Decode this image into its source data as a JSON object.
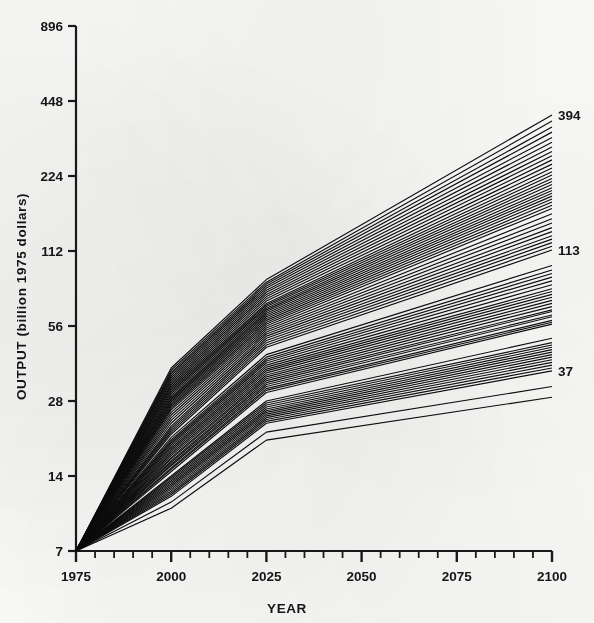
{
  "figure": {
    "name": "output-projection-spaghetti-chart"
  },
  "chart_data": {
    "type": "line",
    "title": "",
    "subtitle": "",
    "xlabel": "YEAR",
    "ylabel": "OUTPUT (billion 1975 dollars)",
    "y_scale": "log2",
    "xlim": [
      1975,
      2100
    ],
    "ylim": [
      7,
      896
    ],
    "grid": false,
    "legend": false,
    "legend_position": "none",
    "x_ticks_major": [
      1975,
      2000,
      2025,
      2050,
      2075,
      2100
    ],
    "x_tick_labels": [
      "1975",
      "2000",
      "2025",
      "2050",
      "2075",
      "2100"
    ],
    "x_ticks_minor_step": 5,
    "y_ticks": [
      7,
      14,
      28,
      56,
      112,
      224,
      448,
      896
    ],
    "y_tick_labels": [
      "7",
      "14",
      "28",
      "56",
      "112",
      "224",
      "448",
      "896"
    ],
    "annotations": [
      {
        "label": "394",
        "x": 2100,
        "y": 394,
        "note": "highest-scenario endpoint"
      },
      {
        "label": "113",
        "x": 2100,
        "y": 113,
        "note": "mid-scenario endpoint"
      },
      {
        "label": "37",
        "x": 2100,
        "y": 37,
        "note": "lowest-scenario endpoint"
      }
    ],
    "x_knots": [
      1975,
      2000,
      2025,
      2100
    ],
    "common_origin": {
      "x": 1975,
      "y": 7
    },
    "series": [
      {
        "name": "S01",
        "values": [
          7,
          38.0,
          86.0,
          394
        ]
      },
      {
        "name": "S02",
        "values": [
          7,
          37.2,
          84.0,
          372
        ]
      },
      {
        "name": "S03",
        "values": [
          7,
          36.5,
          82.5,
          352
        ]
      },
      {
        "name": "S04",
        "values": [
          7,
          36.0,
          81.0,
          336
        ]
      },
      {
        "name": "S05",
        "values": [
          7,
          35.4,
          79.5,
          320
        ]
      },
      {
        "name": "S06",
        "values": [
          7,
          34.8,
          78.0,
          306
        ]
      },
      {
        "name": "S07",
        "values": [
          7,
          34.2,
          76.5,
          293
        ]
      },
      {
        "name": "S08",
        "values": [
          7,
          33.6,
          75.0,
          281
        ]
      },
      {
        "name": "S09",
        "values": [
          7,
          33.0,
          73.5,
          270
        ]
      },
      {
        "name": "S10",
        "values": [
          7,
          32.5,
          72.0,
          260
        ]
      },
      {
        "name": "S11",
        "values": [
          7,
          32.0,
          70.5,
          250
        ]
      },
      {
        "name": "S12",
        "values": [
          7,
          31.5,
          69.0,
          241
        ]
      },
      {
        "name": "S13",
        "values": [
          7,
          31.0,
          68.0,
          233
        ]
      },
      {
        "name": "S14",
        "values": [
          7,
          30.5,
          67.0,
          226
        ]
      },
      {
        "name": "S15",
        "values": [
          7,
          30.0,
          66.0,
          219
        ]
      },
      {
        "name": "S16",
        "values": [
          7,
          29.5,
          65.0,
          213
        ]
      },
      {
        "name": "S17",
        "values": [
          7,
          29.0,
          64.0,
          207
        ]
      },
      {
        "name": "S18",
        "values": [
          7,
          28.6,
          63.0,
          201
        ]
      },
      {
        "name": "S19",
        "values": [
          7,
          28.2,
          62.0,
          196
        ]
      },
      {
        "name": "S20",
        "values": [
          7,
          27.8,
          61.0,
          191
        ]
      },
      {
        "name": "S21",
        "values": [
          7,
          27.4,
          60.0,
          186
        ]
      },
      {
        "name": "S22",
        "values": [
          7,
          27.0,
          59.0,
          181
        ]
      },
      {
        "name": "S23",
        "values": [
          7,
          26.6,
          58.0,
          176
        ]
      },
      {
        "name": "S24",
        "values": [
          7,
          26.2,
          57.0,
          171
        ]
      },
      {
        "name": "S25",
        "values": [
          7,
          25.8,
          56.0,
          166
        ]
      },
      {
        "name": "S26",
        "values": [
          7,
          25.2,
          55.0,
          158
        ]
      },
      {
        "name": "S27",
        "values": [
          7,
          24.6,
          54.0,
          151
        ]
      },
      {
        "name": "S28",
        "values": [
          7,
          24.0,
          53.0,
          145
        ]
      },
      {
        "name": "S29",
        "values": [
          7,
          23.4,
          52.0,
          139
        ]
      },
      {
        "name": "S30",
        "values": [
          7,
          22.8,
          51.0,
          134
        ]
      },
      {
        "name": "S31",
        "values": [
          7,
          22.2,
          50.0,
          129
        ]
      },
      {
        "name": "S32",
        "values": [
          7,
          21.8,
          49.0,
          125
        ]
      },
      {
        "name": "S33",
        "values": [
          7,
          21.4,
          48.0,
          121
        ]
      },
      {
        "name": "S34",
        "values": [
          7,
          21.0,
          47.0,
          117
        ]
      },
      {
        "name": "S35",
        "values": [
          7,
          20.6,
          46.0,
          113
        ]
      },
      {
        "name": "S36",
        "values": [
          7,
          20.0,
          43.0,
          98
        ]
      },
      {
        "name": "S37",
        "values": [
          7,
          19.6,
          42.0,
          94
        ]
      },
      {
        "name": "S38",
        "values": [
          7,
          19.3,
          41.2,
          91
        ]
      },
      {
        "name": "S39",
        "values": [
          7,
          19.0,
          40.5,
          88
        ]
      },
      {
        "name": "S40",
        "values": [
          7,
          18.7,
          39.8,
          85
        ]
      },
      {
        "name": "S41",
        "values": [
          7,
          18.4,
          39.0,
          82
        ]
      },
      {
        "name": "S42",
        "values": [
          7,
          18.1,
          38.3,
          79
        ]
      },
      {
        "name": "S43",
        "values": [
          7,
          17.8,
          37.6,
          77
        ]
      },
      {
        "name": "S44",
        "values": [
          7,
          17.5,
          37.0,
          75
        ]
      },
      {
        "name": "S45",
        "values": [
          7,
          17.2,
          36.3,
          73
        ]
      },
      {
        "name": "S46",
        "values": [
          7,
          16.9,
          35.6,
          71
        ]
      },
      {
        "name": "S47",
        "values": [
          7,
          16.6,
          35.0,
          69
        ]
      },
      {
        "name": "S48",
        "values": [
          7,
          16.4,
          34.4,
          67
        ]
      },
      {
        "name": "S49",
        "values": [
          7,
          16.1,
          33.8,
          65
        ]
      },
      {
        "name": "S50",
        "values": [
          7,
          15.9,
          33.2,
          64
        ]
      },
      {
        "name": "S51",
        "values": [
          7,
          15.6,
          32.6,
          62
        ]
      },
      {
        "name": "S52",
        "values": [
          7,
          15.4,
          32.0,
          61
        ]
      },
      {
        "name": "S53",
        "values": [
          7,
          15.1,
          31.4,
          59
        ]
      },
      {
        "name": "S54",
        "values": [
          7,
          14.9,
          30.9,
          58
        ]
      },
      {
        "name": "S55",
        "values": [
          7,
          14.6,
          30.3,
          57
        ]
      },
      {
        "name": "S56",
        "values": [
          7,
          14.0,
          28.0,
          50
        ]
      },
      {
        "name": "S57",
        "values": [
          7,
          13.8,
          27.5,
          48
        ]
      },
      {
        "name": "S58",
        "values": [
          7,
          13.6,
          27.0,
          47
        ]
      },
      {
        "name": "S59",
        "values": [
          7,
          13.4,
          26.5,
          46
        ]
      },
      {
        "name": "S60",
        "values": [
          7,
          13.2,
          26.0,
          45
        ]
      },
      {
        "name": "S61",
        "values": [
          7,
          13.0,
          25.6,
          44
        ]
      },
      {
        "name": "S62",
        "values": [
          7,
          12.8,
          25.2,
          43
        ]
      },
      {
        "name": "S63",
        "values": [
          7,
          12.6,
          24.8,
          42
        ]
      },
      {
        "name": "S64",
        "values": [
          7,
          12.4,
          24.4,
          41
        ]
      },
      {
        "name": "S65",
        "values": [
          7,
          12.2,
          24.0,
          40
        ]
      },
      {
        "name": "S66",
        "values": [
          7,
          12.0,
          23.6,
          39
        ]
      },
      {
        "name": "S67",
        "values": [
          7,
          11.8,
          23.2,
          38
        ]
      },
      {
        "name": "S68",
        "values": [
          7,
          11.6,
          22.8,
          37
        ]
      },
      {
        "name": "S69",
        "values": [
          7,
          11.0,
          21.0,
          32
        ]
      },
      {
        "name": "S70",
        "values": [
          7,
          10.4,
          19.5,
          29
        ]
      }
    ]
  },
  "axes": {
    "y_axis_name": "output-axis",
    "x_axis_name": "year-axis"
  }
}
